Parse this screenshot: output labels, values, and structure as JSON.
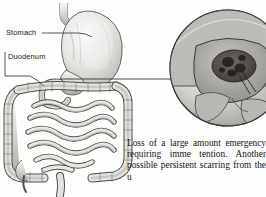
{
  "figure": {
    "style": "grayscale engraving",
    "labels": [
      {
        "id": "stomach",
        "text": "Stomach",
        "leader": "line"
      },
      {
        "id": "duodenum",
        "text": "Duodenum",
        "leader": "bracket"
      }
    ],
    "inset": {
      "name": "ulcer-magnification-inset",
      "shape": "circle",
      "depicts": "cutaway view of duodenal wall showing an ulcer crater with bleeding vessel"
    },
    "main_drawing": {
      "name": "digestive-tract-drawing",
      "depicts": "stomach, duodenum, small intestine and large intestine"
    },
    "connector": {
      "name": "inset-leader-line",
      "from": "duodenum",
      "to": "inset"
    }
  },
  "caption": {
    "text": "Loss of a large amount emergency requiring imme tention. Another possible persistent scarring from the u",
    "lines": [
      "Loss of a large amount",
      "emergency requiring imme",
      "tention. Another possible",
      "persistent scarring from the u"
    ]
  },
  "colors": {
    "ink": "#141414",
    "line": "#3a3a3a",
    "organ_fill": "#e9e9e7",
    "organ_shade": "#b9b9b6",
    "organ_dark": "#8c8c89",
    "ulcer_dark": "#4a4744",
    "page": "#ffffff"
  }
}
